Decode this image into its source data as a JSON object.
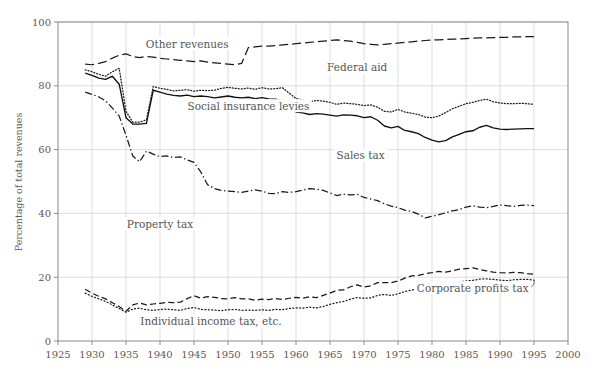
{
  "chart_data": {
    "type": "line",
    "title": "",
    "subtitle": "",
    "xlabel": "",
    "ylabel": "Percentage of total revenues",
    "xlim": [
      1925,
      2000
    ],
    "ylim": [
      0,
      100
    ],
    "xticks": [
      1925,
      1930,
      1935,
      1940,
      1945,
      1950,
      1955,
      1960,
      1965,
      1970,
      1975,
      1980,
      1985,
      1990,
      1995,
      2000
    ],
    "yticks": [
      0,
      20,
      40,
      60,
      80,
      100
    ],
    "grid": true,
    "legend_position": "inline-annotations",
    "x": [
      1929,
      1930,
      1931,
      1932,
      1933,
      1934,
      1935,
      1936,
      1937,
      1938,
      1939,
      1940,
      1941,
      1942,
      1943,
      1944,
      1945,
      1946,
      1947,
      1948,
      1949,
      1950,
      1951,
      1952,
      1953,
      1954,
      1955,
      1956,
      1957,
      1958,
      1959,
      1960,
      1961,
      1962,
      1963,
      1964,
      1965,
      1966,
      1967,
      1968,
      1969,
      1970,
      1971,
      1972,
      1973,
      1974,
      1975,
      1976,
      1977,
      1978,
      1979,
      1980,
      1981,
      1982,
      1983,
      1984,
      1985,
      1986,
      1987,
      1988,
      1989,
      1990,
      1991,
      1992,
      1993,
      1994,
      1995
    ],
    "series": [
      {
        "name": "Corporate profits tax",
        "label": "Corporate profits tax",
        "style": "dotted",
        "color": "#1a1a1a",
        "values": [
          15.0,
          14.0,
          13.2,
          12.4,
          11.3,
          10.2,
          9.0,
          10.0,
          10.3,
          9.8,
          9.6,
          9.9,
          10.0,
          9.8,
          9.6,
          10.2,
          10.5,
          9.9,
          9.8,
          9.7,
          9.5,
          9.8,
          9.9,
          9.6,
          9.7,
          9.6,
          9.8,
          9.6,
          9.9,
          9.8,
          10.2,
          10.4,
          10.3,
          10.6,
          10.4,
          10.8,
          11.5,
          12.0,
          12.4,
          13.1,
          13.6,
          13.4,
          13.5,
          14.3,
          14.6,
          14.3,
          14.8,
          15.5,
          16.0,
          16.4,
          16.9,
          17.4,
          17.9,
          17.8,
          18.1,
          18.6,
          18.8,
          19.0,
          19.4,
          19.5,
          19.3,
          19.1,
          18.9,
          19.2,
          19.3,
          19.3,
          19.1
        ]
      },
      {
        "name": "Individual income tax, etc.",
        "label": "Individual income tax, etc.",
        "style": "dashed",
        "color": "#1a1a1a",
        "values": [
          16.2,
          15.0,
          14.0,
          13.2,
          12.0,
          10.8,
          9.3,
          11.3,
          11.9,
          11.3,
          11.6,
          11.8,
          12.1,
          12.0,
          12.2,
          13.3,
          14.2,
          13.4,
          13.9,
          13.7,
          13.3,
          13.2,
          13.6,
          13.2,
          13.2,
          12.8,
          13.1,
          13.0,
          13.3,
          13.0,
          13.4,
          13.7,
          13.4,
          13.9,
          13.6,
          14.3,
          15.0,
          15.9,
          16.0,
          17.0,
          17.6,
          16.9,
          17.3,
          18.3,
          18.3,
          18.3,
          18.8,
          19.7,
          20.4,
          20.6,
          21.1,
          21.4,
          21.8,
          21.6,
          22.0,
          22.5,
          22.7,
          22.9,
          22.4,
          22.0,
          21.6,
          21.4,
          21.3,
          21.5,
          21.4,
          21.1,
          20.9
        ]
      },
      {
        "name": "Property tax",
        "label": "Property tax",
        "style": "dashdot",
        "color": "#1a1a1a",
        "values": [
          78.0,
          77.3,
          76.5,
          75.3,
          73.0,
          70.5,
          64.5,
          58.0,
          56.2,
          59.5,
          58.6,
          57.8,
          58.0,
          57.5,
          57.7,
          56.8,
          56.0,
          53.0,
          49.0,
          47.8,
          47.2,
          47.0,
          46.8,
          46.6,
          47.0,
          47.4,
          47.0,
          46.3,
          46.2,
          46.8,
          46.6,
          46.8,
          47.3,
          47.8,
          47.6,
          47.2,
          46.4,
          45.6,
          46.0,
          45.8,
          46.0,
          45.0,
          44.5,
          44.0,
          43.0,
          42.3,
          41.8,
          41.0,
          40.6,
          39.8,
          38.6,
          39.1,
          39.6,
          40.2,
          40.8,
          41.2,
          42.0,
          42.4,
          42.0,
          41.8,
          42.2,
          42.7,
          42.4,
          42.2,
          42.5,
          42.6,
          42.4
        ]
      },
      {
        "name": "Sales tax",
        "label": "Sales tax",
        "style": "solid",
        "color": "#111111",
        "values": [
          84.0,
          83.3,
          82.4,
          82.0,
          83.0,
          80.5,
          70.0,
          68.0,
          68.0,
          68.2,
          78.6,
          78.0,
          77.4,
          77.0,
          76.8,
          77.1,
          76.6,
          76.8,
          76.6,
          76.2,
          76.5,
          76.8,
          76.4,
          76.2,
          76.4,
          76.0,
          76.3,
          75.9,
          75.8,
          75.2,
          73.3,
          71.8,
          71.5,
          71.0,
          71.3,
          71.1,
          70.8,
          70.5,
          70.9,
          70.8,
          70.6,
          70.0,
          70.3,
          69.2,
          67.4,
          66.8,
          67.3,
          66.0,
          65.6,
          65.0,
          63.8,
          63.0,
          62.4,
          62.8,
          64.0,
          64.8,
          65.6,
          65.9,
          67.0,
          67.6,
          66.8,
          66.4,
          66.3,
          66.4,
          66.5,
          66.6,
          66.6
        ]
      },
      {
        "name": "Social insurance levies",
        "label": "Social insurance levies",
        "style": "densely-dotted",
        "color": "#1a1a1a",
        "values": [
          85.0,
          84.4,
          83.6,
          83.0,
          84.4,
          85.5,
          72.0,
          68.6,
          68.6,
          69.3,
          79.8,
          79.2,
          78.9,
          78.4,
          78.6,
          78.8,
          78.3,
          78.6,
          78.5,
          78.6,
          79.2,
          79.5,
          79.2,
          79.0,
          79.3,
          78.9,
          79.4,
          79.0,
          79.1,
          79.4,
          77.7,
          76.0,
          75.6,
          75.0,
          75.4,
          75.2,
          74.8,
          74.2,
          74.6,
          74.4,
          74.2,
          73.8,
          74.0,
          73.3,
          72.0,
          71.8,
          72.6,
          71.8,
          71.4,
          71.0,
          70.2,
          70.0,
          70.5,
          71.6,
          72.8,
          73.6,
          74.4,
          74.8,
          75.4,
          75.8,
          75.0,
          74.6,
          74.4,
          74.4,
          74.5,
          74.4,
          74.2
        ]
      },
      {
        "name": "Federal aid",
        "label": "Federal aid",
        "style": "long-dashed",
        "color": "#1a1a1a",
        "values": [
          86.8,
          86.6,
          87.0,
          87.6,
          88.7,
          89.6,
          90.0,
          89.2,
          88.8,
          89.2,
          89.0,
          88.6,
          88.4,
          88.2,
          88.0,
          87.8,
          87.6,
          87.8,
          87.4,
          87.2,
          87.0,
          86.8,
          86.6,
          87.0,
          92.0,
          92.2,
          92.4,
          92.4,
          92.6,
          92.8,
          93.0,
          93.2,
          93.4,
          93.6,
          93.8,
          94.0,
          94.2,
          94.4,
          94.2,
          94.0,
          93.6,
          93.2,
          93.0,
          92.8,
          93.0,
          93.2,
          93.4,
          93.6,
          93.8,
          94.0,
          94.2,
          94.4,
          94.4,
          94.5,
          94.6,
          94.7,
          94.8,
          94.9,
          95.0,
          95.0,
          95.1,
          95.2,
          95.2,
          95.3,
          95.3,
          95.4,
          95.4
        ]
      },
      {
        "name": "Other revenues",
        "label": "Other revenues",
        "style": "top-band",
        "color": "#1a1a1a",
        "values": [
          100,
          100,
          100,
          100,
          100,
          100,
          100,
          100,
          100,
          100,
          100,
          100,
          100,
          100,
          100,
          100,
          100,
          100,
          100,
          100,
          100,
          100,
          100,
          100,
          100,
          100,
          100,
          100,
          100,
          100,
          100,
          100,
          100,
          100,
          100,
          100,
          100,
          100,
          100,
          100,
          100,
          100,
          100,
          100,
          100,
          100,
          100,
          100,
          100,
          100,
          100,
          100,
          100,
          100,
          100,
          100,
          100,
          100,
          100,
          100,
          100,
          100,
          100,
          100,
          100,
          100,
          100
        ]
      }
    ],
    "annotations": [
      {
        "text": "Other revenues",
        "x": 1944.0,
        "y": 92.0,
        "anchor": "middle"
      },
      {
        "text": "Federal aid",
        "x": 1969.0,
        "y": 84.5,
        "anchor": "middle"
      },
      {
        "text": "Social insurance levies",
        "x": 1953.0,
        "y": 72.5,
        "anchor": "middle"
      },
      {
        "text": "Sales tax",
        "x": 1969.5,
        "y": 57.0,
        "anchor": "middle"
      },
      {
        "text": "Property tax",
        "x": 1940.0,
        "y": 35.5,
        "anchor": "middle"
      },
      {
        "text": "Individual income tax, etc.",
        "x": 1947.5,
        "y": 5.0,
        "anchor": "middle"
      },
      {
        "text": "Corporate profits tax",
        "x": 1986.0,
        "y": 15.5,
        "anchor": "middle"
      }
    ]
  },
  "axis": {
    "ylabel": "Percentage of total revenues",
    "ytick_labels": [
      "0",
      "20",
      "40",
      "60",
      "80",
      "100"
    ],
    "xtick_labels": [
      "1925",
      "1930",
      "1935",
      "1940",
      "1945",
      "1950",
      "1955",
      "1960",
      "1965",
      "1970",
      "1975",
      "1980",
      "1985",
      "1990",
      "1995",
      "2000"
    ]
  },
  "colors": {
    "line": "#1a1a1a",
    "grid": "#cfcfcf",
    "frame": "#8a8a8a",
    "text": "#555555",
    "background": "#ffffff"
  }
}
